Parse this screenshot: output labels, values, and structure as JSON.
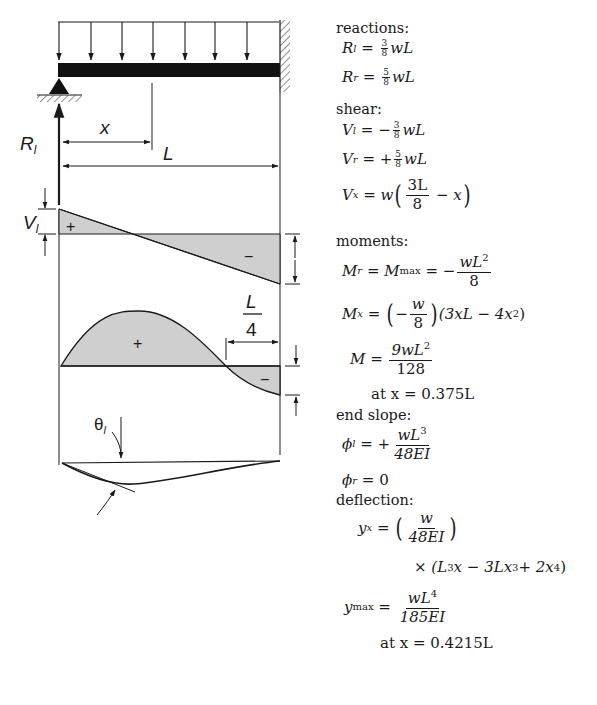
{
  "figure": {
    "labels": {
      "left_reaction": "R",
      "left_reaction_sub": "l",
      "position_var": "x",
      "span": "L",
      "shear_left": "V",
      "shear_left_sub": "l",
      "shear_right": "V",
      "shear_right_sub": "r",
      "quarter_num": "L",
      "quarter_den": "4",
      "moment_right": "M",
      "moment_right_sub": "r",
      "slope_angle": "θ",
      "slope_angle_sub": "l",
      "positive_sign": "+",
      "negative_sign": "−"
    },
    "load_arrow_count": 7
  },
  "formulas": {
    "reactions": {
      "heading": "reactions:",
      "R_l": {
        "lhs": "R",
        "sub": "l",
        "num": "3",
        "den": "8",
        "rest": "wL"
      },
      "R_r": {
        "lhs": "R",
        "sub": "r",
        "num": "5",
        "den": "8",
        "rest": "wL"
      }
    },
    "shear": {
      "heading": "shear:",
      "V_l": {
        "lhs": "V",
        "sub": "l",
        "sign": "−",
        "num": "3",
        "den": "8",
        "rest": "wL"
      },
      "V_r": {
        "lhs": "V",
        "sub": "r",
        "sign": "+",
        "num": "5",
        "den": "8",
        "rest": "wL"
      },
      "V_x": {
        "lhs": "V",
        "sub": "x",
        "prefix": "w",
        "num": "3L",
        "den": "8",
        "rest": "− x"
      }
    },
    "moments": {
      "heading": "moments:",
      "M_r": {
        "lhs": "M",
        "sub": "r",
        "mid": "M",
        "mid_sub": "max",
        "sign": "−",
        "num": "wL",
        "num_sup": "2",
        "den": "8"
      },
      "M_x": {
        "lhs": "M",
        "sub": "x",
        "sign": "−",
        "num": "w",
        "den": "8",
        "rest": "(3xL − 4x",
        "rest_sup": "2",
        "rest_end": ")"
      },
      "M": {
        "lhs": "M",
        "num": "9wL",
        "num_sup": "2",
        "den": "128"
      },
      "M_at": "at x = 0.375L"
    },
    "end_slope": {
      "heading": "end slope:",
      "phi_l": {
        "lhs": "ϕ",
        "sub": "l",
        "sign": "+",
        "num": "wL",
        "num_sup": "3",
        "den": "48EI"
      },
      "phi_r": {
        "lhs": "ϕ",
        "sub": "r",
        "rhs": "0"
      }
    },
    "deflection": {
      "heading": "deflection:",
      "y_x": {
        "lhs": "y",
        "sub": "x",
        "num": "w",
        "den": "48EI"
      },
      "y_x_cont": {
        "times": "×",
        "a": "(L",
        "a_sup": "3",
        "b": "x − 3Lx",
        "b_sup": "3",
        "c": " + 2x",
        "c_sup": "4",
        "d": ")"
      },
      "y_max": {
        "lhs": "y",
        "sub": "max",
        "num": "wL",
        "num_sup": "4",
        "den": "185EI"
      },
      "y_at": "at x = 0.4215L"
    }
  }
}
